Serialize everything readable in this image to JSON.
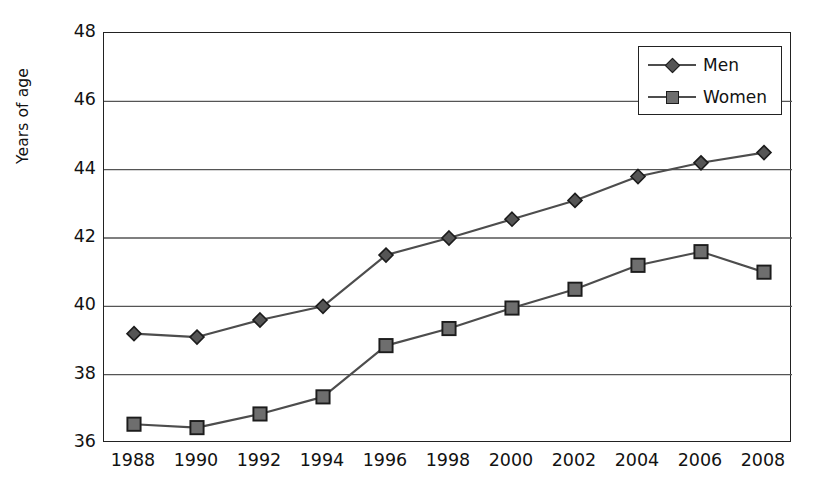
{
  "chart_data": {
    "type": "line",
    "title": "",
    "xlabel": "",
    "ylabel": "Years of age",
    "categories": [
      "1988",
      "1990",
      "1992",
      "1994",
      "1996",
      "1998",
      "2000",
      "2002",
      "2004",
      "2006",
      "2008"
    ],
    "ylim": [
      36,
      48
    ],
    "yticks": [
      36,
      38,
      40,
      42,
      44,
      46,
      48
    ],
    "ytick_labels": [
      "36",
      "38",
      "40",
      "42",
      "44",
      "46",
      "48"
    ],
    "grid": "horizontal",
    "legend_position": "top-right",
    "series": [
      {
        "name": "Men",
        "marker": "diamond",
        "color": "#555555",
        "values": [
          39.2,
          39.1,
          39.6,
          40.0,
          41.5,
          42.0,
          42.55,
          43.1,
          43.8,
          44.2,
          44.5
        ]
      },
      {
        "name": "Women",
        "marker": "square",
        "color": "#6e6e6e",
        "values": [
          36.55,
          36.45,
          36.85,
          37.35,
          38.85,
          39.35,
          39.95,
          40.5,
          41.2,
          41.6,
          41.0
        ]
      }
    ]
  },
  "legend": {
    "entries": [
      {
        "label": "Men"
      },
      {
        "label": "Women"
      }
    ]
  },
  "axis": {
    "y_title": "Years of age"
  },
  "colors": {
    "line": "#4d4d4d",
    "grid": "#555555",
    "frame": "#222222",
    "text": "#121212",
    "background": "#ffffff"
  }
}
